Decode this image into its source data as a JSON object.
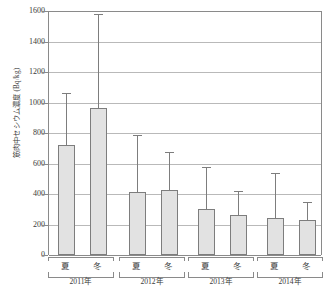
{
  "chart_data": {
    "type": "bar",
    "title": "",
    "xlabel": "",
    "ylabel": "筋肉中セシウム濃度 (Bq/kg)",
    "ylim": [
      0,
      1600
    ],
    "ytick_step": 200,
    "yticks": [
      "1600",
      "1400",
      "1200",
      "1000",
      "800",
      "600",
      "400",
      "200",
      "0"
    ],
    "grid": true,
    "legend": "none",
    "categories": [
      "夏",
      "冬",
      "夏",
      "冬",
      "夏",
      "冬",
      "夏",
      "冬"
    ],
    "groups": [
      {
        "label": "2011年",
        "seasons": [
          "夏",
          "冬"
        ]
      },
      {
        "label": "2012年",
        "seasons": [
          "夏",
          "冬"
        ]
      },
      {
        "label": "2013年",
        "seasons": [
          "夏",
          "冬"
        ]
      },
      {
        "label": "2014年",
        "seasons": [
          "夏",
          "冬"
        ]
      }
    ],
    "values": [
      720,
      965,
      415,
      425,
      300,
      265,
      245,
      228
    ],
    "error_upper": [
      1065,
      1580,
      785,
      675,
      575,
      420,
      535,
      350
    ],
    "bars": [
      {
        "group": "2011年",
        "season": "夏",
        "value": 720,
        "error_top": 1065
      },
      {
        "group": "2011年",
        "season": "冬",
        "value": 965,
        "error_top": 1580
      },
      {
        "group": "2012年",
        "season": "夏",
        "value": 415,
        "error_top": 785
      },
      {
        "group": "2012年",
        "season": "冬",
        "value": 425,
        "error_top": 675
      },
      {
        "group": "2013年",
        "season": "夏",
        "value": 300,
        "error_top": 575
      },
      {
        "group": "2013年",
        "season": "冬",
        "value": 265,
        "error_top": 420
      },
      {
        "group": "2014年",
        "season": "夏",
        "value": 245,
        "error_top": 535
      },
      {
        "group": "2014年",
        "season": "冬",
        "value": 228,
        "error_top": 350
      }
    ],
    "colors": {
      "bar_fill": "#e2e2e2",
      "bar_stroke": "#7d7d7d",
      "grid": "#b9b9b9",
      "axis": "#8a8a8a",
      "text": "#3a3a3a"
    }
  }
}
